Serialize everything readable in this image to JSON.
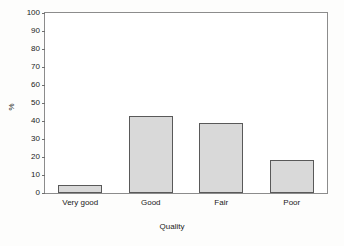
{
  "chart_data": {
    "type": "bar",
    "title": "",
    "subtitle": "",
    "xlabel": "Quality",
    "ylabel": "%",
    "categories": [
      "Very good",
      "Good",
      "Fair",
      "Poor"
    ],
    "values": [
      4.5,
      43,
      39,
      18.5
    ],
    "series": [
      {
        "name": "Percent",
        "values": [
          4.5,
          43,
          39,
          18.5
        ]
      }
    ],
    "ylim": [
      0,
      100
    ],
    "ytick_labels": [
      "0",
      "10",
      "20",
      "30",
      "40",
      "50",
      "60",
      "70",
      "80",
      "90",
      "100"
    ],
    "ytick_values": [
      0,
      10,
      20,
      30,
      40,
      50,
      60,
      70,
      80,
      90,
      100
    ],
    "grid": false,
    "legend": false,
    "legend_position": "none",
    "annotations": [],
    "colors": {
      "bar_fill": "#d9d9d9",
      "bar_border": "#595959",
      "frame": "#8c8c8c",
      "text": "#1a1a1a",
      "plot_background": "#ffffff",
      "page_background": "#fdfdfc"
    }
  }
}
